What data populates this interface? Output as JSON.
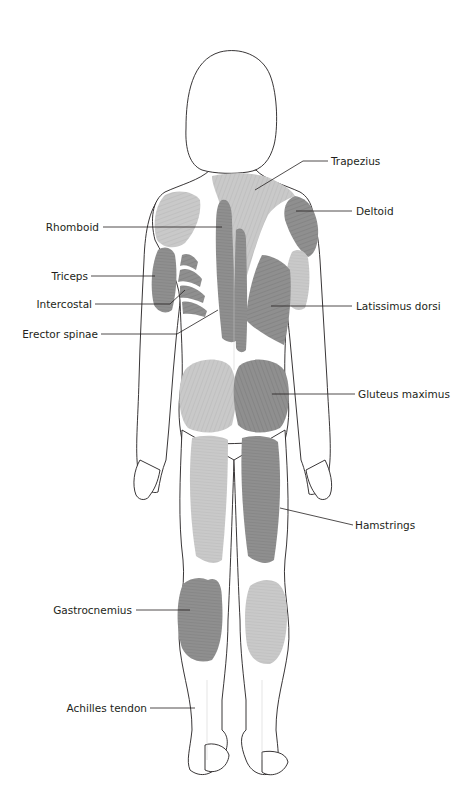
{
  "diagram": {
    "colors": {
      "dark_muscle": "#8f8f8f",
      "light_muscle": "#c9c9c9",
      "outline": "#231f20",
      "label_text": "#231f20",
      "background": "#ffffff"
    },
    "labels": {
      "left": [
        {
          "id": "rhomboid",
          "text": "Rhomboid"
        },
        {
          "id": "triceps",
          "text": "Triceps"
        },
        {
          "id": "intercostal",
          "text": "Intercostal"
        },
        {
          "id": "erector_spinae",
          "text": "Erector spinae"
        },
        {
          "id": "gastrocnemius",
          "text": "Gastrocnemius"
        },
        {
          "id": "achilles_tendon",
          "text": "Achilles tendon"
        }
      ],
      "right": [
        {
          "id": "trapezius",
          "text": "Trapezius"
        },
        {
          "id": "deltoid",
          "text": "Deltoid"
        },
        {
          "id": "latissimus_dorsi",
          "text": "Latissimus dorsi"
        },
        {
          "id": "gluteus_maximus",
          "text": "Gluteus maximus"
        },
        {
          "id": "hamstrings",
          "text": "Hamstrings"
        }
      ]
    }
  }
}
